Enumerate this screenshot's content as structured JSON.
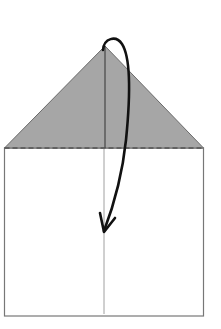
{
  "diagram": {
    "type": "origami-fold-instruction",
    "colors": {
      "background": "#ffffff",
      "paper_outline": "#777777",
      "shaded_flap": "#a6a6a6",
      "flap_outline": "#666666",
      "arrow": "#111111",
      "center_crease": "#999999"
    },
    "elements": {
      "paper": {
        "shape": "rectangle",
        "x": 5,
        "y": 148,
        "width": 198,
        "height": 168
      },
      "flap": {
        "shape": "triangle",
        "apex": [
          105,
          46
        ],
        "base_left": [
          5,
          148
        ],
        "base_right": [
          203,
          148
        ]
      },
      "valley_fold_line": {
        "style": "dashed",
        "y": 148
      },
      "center_crease": {
        "x": 104
      },
      "fold_arrow": {
        "direction": "down",
        "start": [
          103,
          48
        ],
        "end": [
          104,
          232
        ]
      }
    }
  }
}
